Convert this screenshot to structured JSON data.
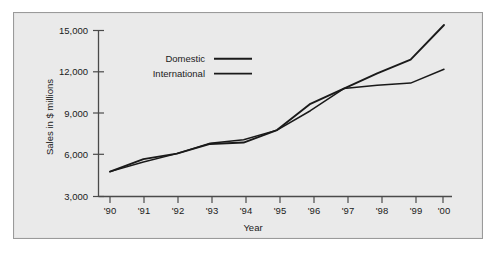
{
  "chart_data": {
    "type": "line",
    "title": "",
    "subtitle": "",
    "xlabel": "Year",
    "ylabel": "Sales in $ millions",
    "x": [
      "'90",
      "'91",
      "'92",
      "'93",
      "'94",
      "'95",
      "'96",
      "'97",
      "'98",
      "'99",
      "'00"
    ],
    "categories": [
      "'90",
      "'91",
      "'92",
      "'93",
      "'94",
      "'95",
      "'96",
      "'97",
      "'98",
      "'99",
      "'00"
    ],
    "series": [
      {
        "name": "Domestic",
        "color": "#1a1a1a",
        "values": [
          4800,
          5700,
          6100,
          6800,
          6900,
          7800,
          9700,
          10800,
          11900,
          12900,
          15400
        ]
      },
      {
        "name": "International",
        "color": "#1a1a1a",
        "values": [
          4800,
          5500,
          6100,
          6850,
          7100,
          7800,
          9200,
          10800,
          11050,
          11200,
          12200
        ]
      }
    ],
    "ylim": [
      3000,
      15000
    ],
    "yticks": [
      3000,
      6000,
      9000,
      12000,
      15000
    ],
    "ytick_labels": [
      "3,000",
      "6,000",
      "9,000",
      "12,000",
      "15,000"
    ],
    "xtick_labels": [
      "'90",
      "'91",
      "'92",
      "'93",
      "'94",
      "'95",
      "'96",
      "'97",
      "'98",
      "'99",
      "'00"
    ],
    "grid": false,
    "legend_position": "upper-left-inside",
    "legend_entries": [
      "Domestic",
      "International"
    ],
    "background_color": "#eaeaea",
    "frame_color": "#9a9a9a",
    "line_color": "#1a1a1a"
  },
  "axes": {
    "y_title": "Sales in $ millions",
    "x_title": "Year"
  },
  "legend": {
    "domestic_label": "Domestic",
    "international_label": "International"
  },
  "ticks": {
    "y": [
      "15,000",
      "12,000",
      "9,000",
      "6,000",
      "3,000"
    ],
    "x": [
      "'90",
      "'91",
      "'92",
      "'93",
      "'94",
      "'95",
      "'96",
      "'97",
      "'98",
      "'99",
      "'00"
    ]
  }
}
